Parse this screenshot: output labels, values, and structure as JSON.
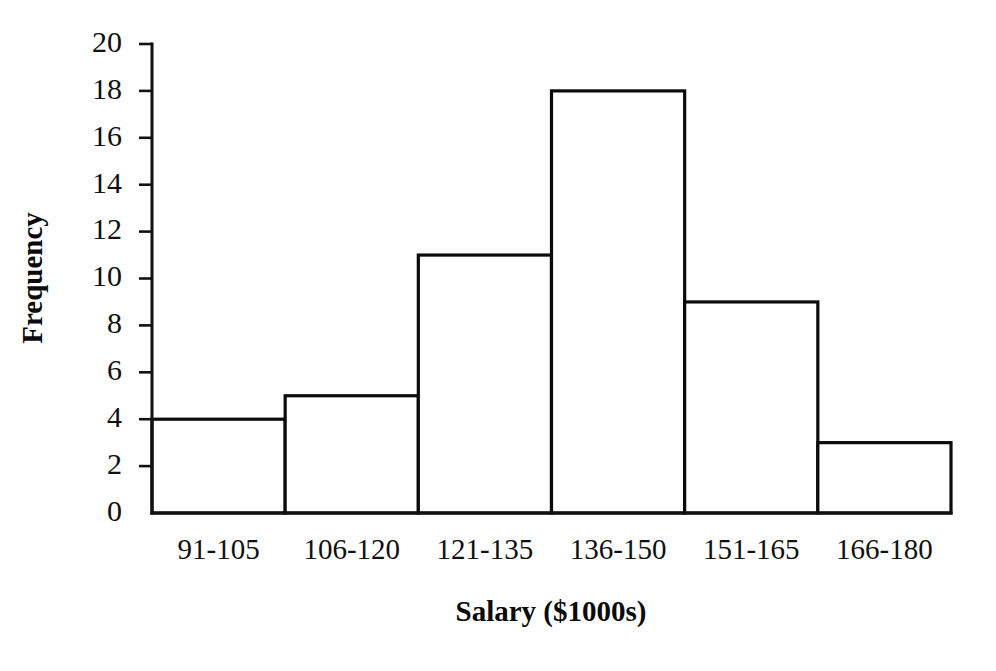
{
  "chart_data": {
    "type": "bar",
    "title": "",
    "subtitle": "",
    "xlabel": "Salary ($1000s)",
    "ylabel": "Frequency",
    "categories": [
      "91-105",
      "106-120",
      "121-135",
      "136-150",
      "151-165",
      "166-180"
    ],
    "values": [
      4,
      5,
      11,
      18,
      9,
      3
    ],
    "ylim": [
      0,
      20
    ],
    "ytick_labels": [
      "0",
      "2",
      "4",
      "6",
      "8",
      "10",
      "12",
      "14",
      "16",
      "18",
      "20"
    ],
    "ytick_values": [
      0,
      2,
      4,
      6,
      8,
      10,
      12,
      14,
      16,
      18,
      20
    ],
    "ystep": 2,
    "grid": false,
    "legend": false,
    "legend_position": "none",
    "bar_style": "outlined-unfilled",
    "colors": {
      "bar_fill": "#ffffff",
      "bar_stroke": "#0b0b0b",
      "axis": "#111111",
      "text": "#101010",
      "background": "#fefefe"
    }
  }
}
